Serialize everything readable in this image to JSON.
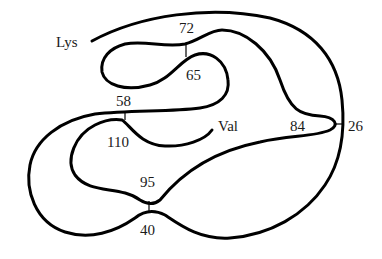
{
  "diagram": {
    "type": "protein-chain-disulfide-diagram",
    "termini": {
      "n_terminus": "Lys",
      "c_terminus": "Val"
    },
    "residue_labels": [
      "72",
      "65",
      "58",
      "110",
      "84",
      "26",
      "95",
      "40"
    ],
    "disulfide_bonds": [
      {
        "from": "72",
        "to": "65"
      },
      {
        "from": "58",
        "to": "110"
      },
      {
        "from": "84",
        "to": "26"
      },
      {
        "from": "95",
        "to": "40"
      }
    ],
    "labels": {
      "lys": "Lys",
      "val": "Val",
      "r72": "72",
      "r65": "65",
      "r58": "58",
      "r110": "110",
      "r84": "84",
      "r26": "26",
      "r95": "95",
      "r40": "40"
    },
    "colors": {
      "line": "#000000",
      "background": "#ffffff"
    }
  }
}
